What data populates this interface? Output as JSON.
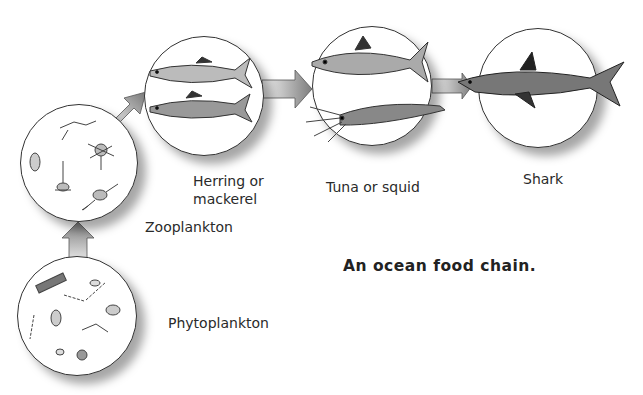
{
  "title": "An ocean food chain.",
  "top_cut_text": "Sea food chain idea",
  "nodes": [
    {
      "id": "phytoplankton",
      "label": "Phytoplankton",
      "icon": "phytoplankton-illustration"
    },
    {
      "id": "zooplankton",
      "label": "Zooplankton",
      "icon": "zooplankton-illustration"
    },
    {
      "id": "herring",
      "label_line1": "Herring or",
      "label_line2": "mackerel",
      "icon": "herring-mackerel-illustration"
    },
    {
      "id": "tuna",
      "label": "Tuna or squid",
      "icon": "tuna-squid-illustration"
    },
    {
      "id": "shark",
      "label": "Shark",
      "icon": "shark-illustration"
    }
  ],
  "edges": [
    {
      "from": "phytoplankton",
      "to": "zooplankton"
    },
    {
      "from": "zooplankton",
      "to": "herring"
    },
    {
      "from": "herring",
      "to": "tuna"
    },
    {
      "from": "tuna",
      "to": "shark"
    }
  ],
  "colors": {
    "arrow_dark": "#7a7a7a",
    "arrow_light": "#f2f2f2",
    "outline": "#333333"
  }
}
